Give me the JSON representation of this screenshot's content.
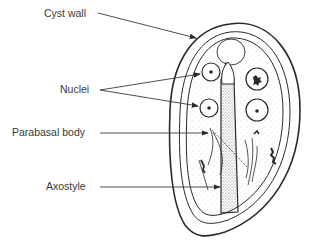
{
  "diagram": {
    "subject": "Cyst",
    "labels": [
      {
        "id": "cyst-wall",
        "text": "Cyst wall"
      },
      {
        "id": "nuclei",
        "text": "Nuclei"
      },
      {
        "id": "parabasal-body",
        "text": "Parabasal body"
      },
      {
        "id": "axostyle",
        "text": "Axostyle"
      }
    ]
  },
  "colors": {
    "ink": "#2a2a2a",
    "text": "#3a3a3a",
    "background": "#ffffff"
  }
}
